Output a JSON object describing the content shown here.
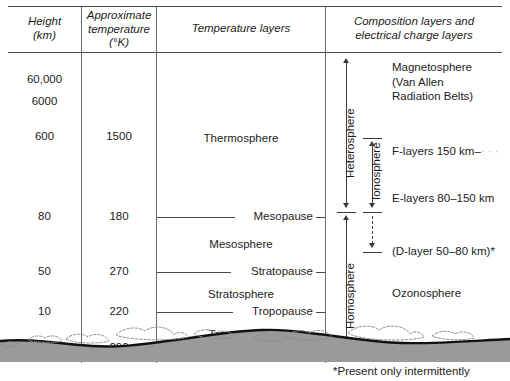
{
  "figure": {
    "type": "diagram"
  },
  "columns": {
    "height": {
      "line1": "Height",
      "line2": "(km)"
    },
    "temperature": {
      "line1": "Approximate",
      "line2": "temperature",
      "line3": "(°K)"
    },
    "temperature_layers": {
      "line1": "Temperature layers"
    },
    "composition_layers": {
      "line1": "Composition layers and",
      "line2": "electrical charge layers"
    }
  },
  "heights": [
    "60,000",
    "6000",
    "600",
    "80",
    "50",
    "10",
    "0"
  ],
  "temperatures": [
    "1500",
    "180",
    "270",
    "220",
    "290"
  ],
  "temperature_layers": {
    "thermosphere": "Thermosphere",
    "mesopause": "Mesopause",
    "mesosphere": "Mesosphere",
    "stratopause": "Stratopause",
    "stratosphere": "Stratosphere",
    "tropopause": "Tropopause",
    "troposphere": "Troposphere"
  },
  "composition": {
    "magnetosphere_l1": "Magnetosphere",
    "magnetosphere_l2": "(Van Allen",
    "magnetosphere_l3": "Radiation Belts)",
    "f_layers": "F-layers 150 km–",
    "e_layers": "E-layers 80–150 km",
    "d_layer": "(D-layer 50–80 km)*",
    "ozonosphere": "Ozonosphere",
    "heterosphere": "Heterosphere",
    "homosphere": "Homosphere",
    "ionosphere": "Ionosphere"
  },
  "footnote": "*Present only intermittently",
  "colors": {
    "ink": "#1c1c1c",
    "rule": "#4a4a4a",
    "divider": "#6a6a6a",
    "ground_fill": "#9a9a9a",
    "terrain_line": "#111111",
    "cloud_line": "#8c8c8c",
    "background": "#ffffff"
  }
}
